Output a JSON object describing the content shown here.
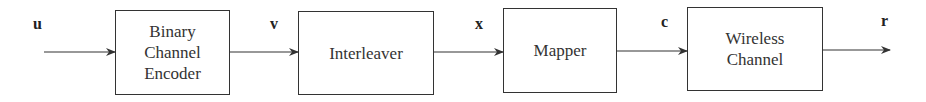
{
  "diagram": {
    "type": "block-diagram",
    "blocks": [
      {
        "id": "encoder",
        "lines": [
          "Binary",
          "Channel",
          "Encoder"
        ]
      },
      {
        "id": "interleaver",
        "lines": [
          "Interleaver"
        ]
      },
      {
        "id": "mapper",
        "lines": [
          "Mapper"
        ]
      },
      {
        "id": "channel",
        "lines": [
          "Wireless",
          "Channel"
        ]
      }
    ],
    "signals": [
      {
        "id": "u",
        "label": "u"
      },
      {
        "id": "v",
        "label": "v"
      },
      {
        "id": "x",
        "label": "x"
      },
      {
        "id": "c",
        "label": "c"
      },
      {
        "id": "r",
        "label": "r"
      }
    ],
    "edges": [
      {
        "from": "input",
        "to": "encoder",
        "signal": "u"
      },
      {
        "from": "encoder",
        "to": "interleaver",
        "signal": "v"
      },
      {
        "from": "interleaver",
        "to": "mapper",
        "signal": "x"
      },
      {
        "from": "mapper",
        "to": "channel",
        "signal": "c"
      },
      {
        "from": "channel",
        "to": "output",
        "signal": "r"
      }
    ]
  }
}
